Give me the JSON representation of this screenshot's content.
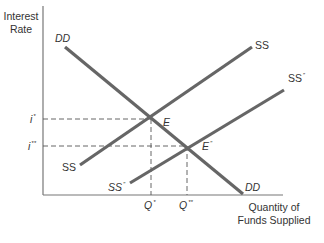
{
  "diagram": {
    "axes": {
      "y_label_line1": "Interest",
      "y_label_line2": "Rate",
      "x_label_line1": "Quantity of",
      "x_label_line2": "Funds Supplied"
    },
    "curves": {
      "demand": {
        "label_top": "DD",
        "label_bottom": "DD",
        "color": "#666666"
      },
      "supply": {
        "label_top": "SS",
        "label_bottom": "SS",
        "color": "#666666"
      },
      "supply_shifted": {
        "label_top_base": "SS",
        "label_top_mark": "″",
        "label_bottom_base": "SS",
        "label_bottom_mark": "″",
        "color": "#666666"
      }
    },
    "equilibria": {
      "original": {
        "label": "E"
      },
      "new": {
        "label_base": "E",
        "label_mark": "″"
      }
    },
    "y_ticks": {
      "i_star_base": "i",
      "i_star_mark": "*",
      "i_dstar_base": "i",
      "i_dstar_mark": "**"
    },
    "x_ticks": {
      "q_star_base": "Q",
      "q_star_mark": "*",
      "q_dstar_base": "Q",
      "q_dstar_mark": "**"
    },
    "colors": {
      "axis": "#777777",
      "curve": "#666666",
      "guide": "#555555",
      "text": "#333333"
    }
  }
}
